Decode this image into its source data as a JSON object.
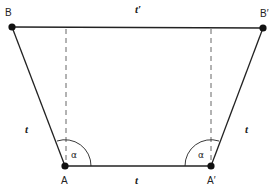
{
  "diagram": {
    "type": "isosceles-trapezoid-construction",
    "colors": {
      "line": "#222222",
      "dashed": "#555555",
      "background": "#ffffff"
    },
    "points": {
      "B": {
        "label": "B",
        "x": 12,
        "y": 27
      },
      "B_prime": {
        "label": "B′",
        "x": 263,
        "y": 28
      },
      "A": {
        "label": "A",
        "x": 65,
        "y": 166
      },
      "A_prime": {
        "label": "A′",
        "x": 211,
        "y": 166
      }
    },
    "edges": {
      "top": {
        "label": "t′"
      },
      "left": {
        "label": "t"
      },
      "right": {
        "label": "t"
      },
      "bottom": {
        "label": "t"
      }
    },
    "angles": {
      "at_A": {
        "label": "α"
      },
      "at_A_prime": {
        "label": "α"
      }
    }
  }
}
